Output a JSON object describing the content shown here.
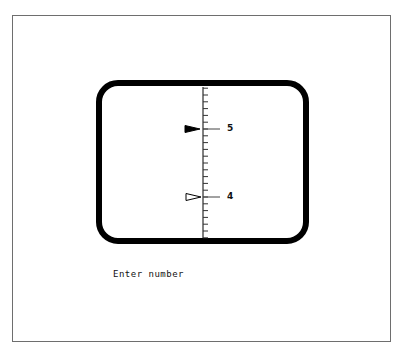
{
  "display": {
    "scale": {
      "major_labels": [
        {
          "value": "5",
          "y": 129
        },
        {
          "value": "4",
          "y": 197
        }
      ],
      "minor_ticks_per_unit": 10
    },
    "indicators": [
      {
        "name": "filled-pointer",
        "value": 5,
        "style": "filled"
      },
      {
        "name": "hollow-pointer",
        "value": 4,
        "style": "hollow"
      }
    ]
  },
  "prompt": {
    "text": "Enter number"
  },
  "colors": {
    "stroke": "#000000",
    "frame": "#6e6e6e",
    "background": "#ffffff"
  }
}
